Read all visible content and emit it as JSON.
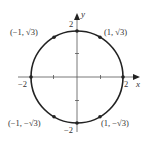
{
  "diagram": {
    "title": "",
    "type": "circle on coordinate plane",
    "circle": {
      "center": [
        0,
        0
      ],
      "radius": 2
    },
    "axes": {
      "x_label": "x",
      "y_label": "y"
    },
    "ticks": {
      "x_pos": "2",
      "x_neg": "−2",
      "y_pos": "2",
      "y_neg": "−2"
    },
    "points": [
      {
        "label": "(1, √3)"
      },
      {
        "label": "(−1, √3)"
      },
      {
        "label": "(−1, −√3)"
      },
      {
        "label": "(1, −√3)"
      }
    ],
    "colors": {
      "line": "#222222",
      "text": "#333333"
    }
  }
}
